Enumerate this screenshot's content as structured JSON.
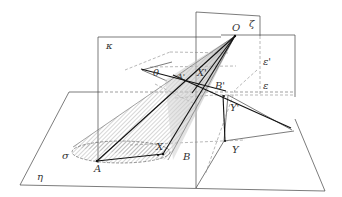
{
  "diagram": {
    "type": "3D geometric construction: cone cut by planes",
    "labels": {
      "O": "O",
      "zeta": "ζ",
      "kappa": "κ",
      "theta": "θ",
      "A_prime": "A'",
      "X_prime": "X'",
      "B_prime": "B'",
      "Y_prime": "Y'",
      "epsilon_prime": "ε'",
      "epsilon": "ε",
      "sigma": "σ",
      "X": "X",
      "A": "A",
      "B": "B",
      "Y": "Y",
      "eta": "η"
    },
    "planes": [
      "κ",
      "ζ",
      "η",
      "ε",
      "ε'"
    ],
    "points": [
      "O",
      "A",
      "B",
      "X",
      "Y",
      "A'",
      "B'",
      "X'",
      "Y'"
    ],
    "angle": "θ",
    "base_circle": "σ",
    "colors": {
      "line": "#333333",
      "dashed": "#777777",
      "hatch": "#999999",
      "cone_fill": "#cccccc"
    }
  }
}
